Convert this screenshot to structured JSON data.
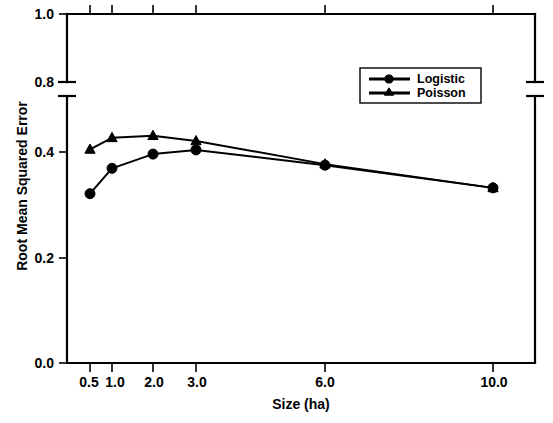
{
  "chart_data": {
    "type": "line",
    "title": "",
    "xlabel": "Size (ha)",
    "ylabel": "Root Mean Squared Error",
    "categories": [
      "0.5",
      "1.0",
      "2.0",
      "3.0",
      "6.0",
      "10.0"
    ],
    "x_tick_labels": [
      "0.5",
      "1.0",
      "2.0",
      "3.0",
      "6.0",
      "10.0"
    ],
    "y_tick_labels": [
      "0.0",
      "0.2",
      "0.4",
      "0.8",
      "1.0"
    ],
    "ylim": [
      0.0,
      1.0
    ],
    "y_axis_break": {
      "present": true,
      "from": 0.45,
      "to": 0.8
    },
    "grid": false,
    "legend_position": "upper right",
    "series": [
      {
        "name": "Logistic",
        "marker": "circle",
        "values": [
          0.321,
          0.369,
          0.396,
          0.404,
          0.375,
          0.332
        ]
      },
      {
        "name": "Poisson",
        "marker": "triangle",
        "values": [
          0.405,
          0.427,
          0.431,
          0.421,
          0.377,
          0.332
        ]
      }
    ]
  },
  "legend": {
    "entries": [
      {
        "label": "Logistic",
        "marker": "circle"
      },
      {
        "label": "Poisson",
        "marker": "triangle"
      }
    ]
  },
  "axes": {
    "x_title": "Size (ha)",
    "y_title": "Root Mean Squared Error"
  },
  "colors": {
    "foreground": "#000000",
    "background": "#ffffff"
  }
}
